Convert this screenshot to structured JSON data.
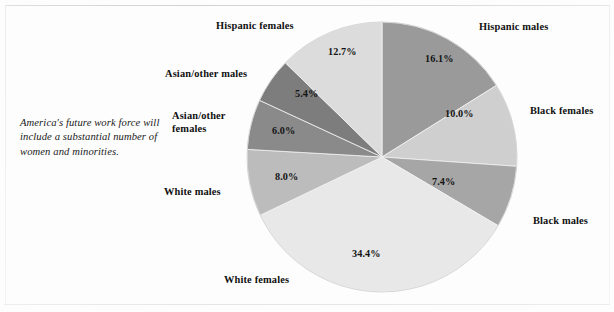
{
  "caption": {
    "text": "America's future work force will include a substantial number of women and minorities."
  },
  "chart_data": {
    "type": "pie",
    "title": "",
    "subtitle": "",
    "xlabel": "",
    "ylabel": "",
    "legend_position": "callout-labels",
    "grid": false,
    "units": "percent",
    "start_angle_deg": 0,
    "direction": "clockwise",
    "center": {
      "x": 382,
      "y": 157
    },
    "radius": 135,
    "categories": [
      "Hispanic males",
      "Black females",
      "Black males",
      "White females",
      "White males",
      "Asian/other females",
      "Asian/other males",
      "Hispanic females"
    ],
    "values": [
      16.1,
      10.0,
      7.4,
      34.4,
      8.0,
      6.0,
      5.4,
      12.7
    ],
    "value_labels": [
      "16.1%",
      "10.0%",
      "7.4%",
      "34.4%",
      "8.0%",
      "6.0%",
      "5.4%",
      "12.7%"
    ],
    "colors": [
      "#9a9a9a",
      "#cfcfcf",
      "#a6a6a6",
      "#e8e8e8",
      "#bcbcbc",
      "#8a8a8a",
      "#7d7d7d",
      "#dcdcdc"
    ],
    "slices": [
      {
        "name": "Hispanic males",
        "value": 16.1,
        "value_label": "16.1%",
        "color": "#9a9a9a",
        "start_deg": 0,
        "end_deg": 57.96,
        "pct_label_pos": {
          "x": 425,
          "y": 53
        },
        "name_label_pos": {
          "x": 479,
          "y": 21
        },
        "name_label_wrap": false
      },
      {
        "name": "Black females",
        "value": 10.0,
        "value_label": "10.0%",
        "color": "#cfcfcf",
        "start_deg": 57.96,
        "end_deg": 93.96,
        "pct_label_pos": {
          "x": 445,
          "y": 108
        },
        "name_label_pos": {
          "x": 530,
          "y": 105
        },
        "name_label_wrap": false
      },
      {
        "name": "Black males",
        "value": 7.4,
        "value_label": "7.4%",
        "color": "#a6a6a6",
        "start_deg": 93.96,
        "end_deg": 120.6,
        "pct_label_pos": {
          "x": 432,
          "y": 176
        },
        "name_label_pos": {
          "x": 533,
          "y": 215
        },
        "name_label_wrap": false
      },
      {
        "name": "White females",
        "value": 34.4,
        "value_label": "34.4%",
        "color": "#e8e8e8",
        "start_deg": 120.6,
        "end_deg": 244.44,
        "pct_label_pos": {
          "x": 352,
          "y": 248
        },
        "name_label_pos": {
          "x": 224,
          "y": 274
        },
        "name_label_wrap": false
      },
      {
        "name": "White males",
        "value": 8.0,
        "value_label": "8.0%",
        "color": "#bcbcbc",
        "start_deg": 244.44,
        "end_deg": 273.24,
        "pct_label_pos": {
          "x": 275,
          "y": 171
        },
        "name_label_pos": {
          "x": 164,
          "y": 186
        },
        "name_label_wrap": false
      },
      {
        "name": "Asian/other females",
        "value": 6.0,
        "value_label": "6.0%",
        "color": "#8a8a8a",
        "start_deg": 273.24,
        "end_deg": 294.84,
        "pct_label_pos": {
          "x": 272,
          "y": 125
        },
        "name_label_pos": {
          "x": 172,
          "y": 109
        },
        "name_label_wrap": true
      },
      {
        "name": "Asian/other males",
        "value": 5.4,
        "value_label": "5.4%",
        "color": "#7d7d7d",
        "start_deg": 294.84,
        "end_deg": 314.28,
        "pct_label_pos": {
          "x": 295,
          "y": 88
        },
        "name_label_pos": {
          "x": 165,
          "y": 68
        },
        "name_label_wrap": false
      },
      {
        "name": "Hispanic females",
        "value": 12.7,
        "value_label": "12.7%",
        "color": "#dcdcdc",
        "start_deg": 314.28,
        "end_deg": 360,
        "pct_label_pos": {
          "x": 328,
          "y": 46
        },
        "name_label_pos": {
          "x": 216,
          "y": 20
        },
        "name_label_wrap": false
      }
    ]
  }
}
